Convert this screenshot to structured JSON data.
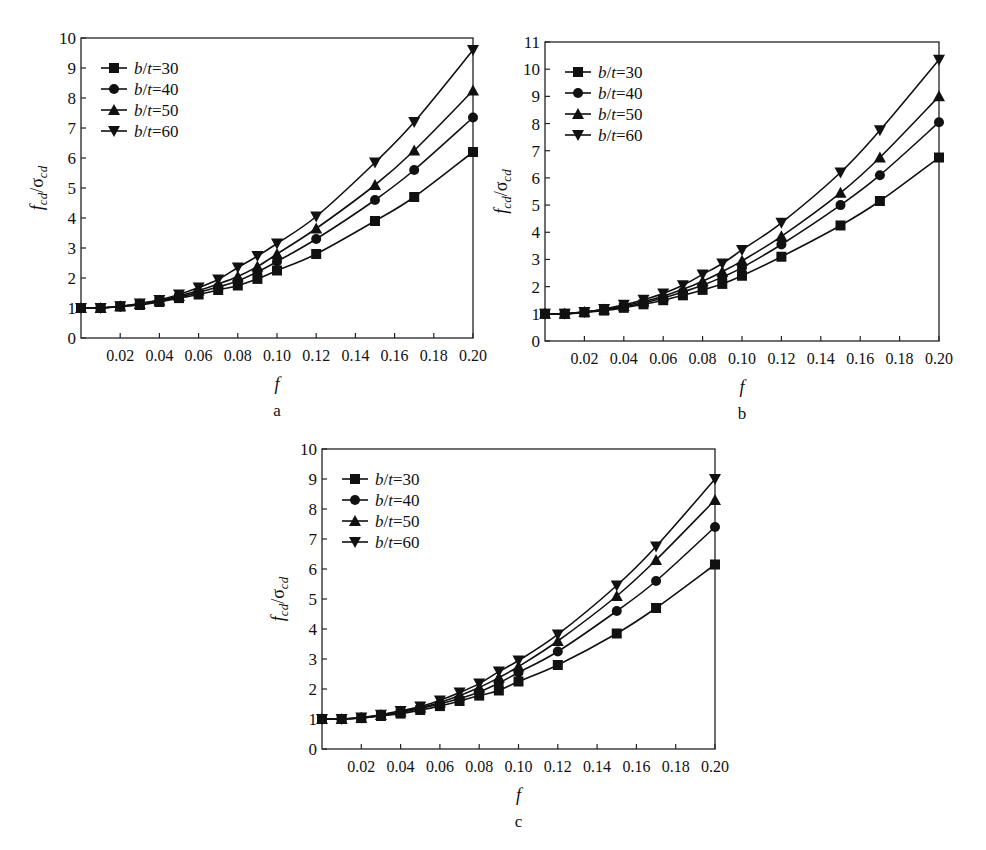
{
  "figure": {
    "panels": [
      {
        "id": "a",
        "sublabel": "a"
      },
      {
        "id": "b",
        "sublabel": "b"
      },
      {
        "id": "c",
        "sublabel": "c"
      }
    ]
  },
  "chart_data": [
    {
      "type": "line",
      "panel": "a",
      "title": "",
      "xlabel": "f",
      "ylabel": "f_cd/σ_cd",
      "xlim": [
        0,
        0.2
      ],
      "ylim": [
        0,
        10
      ],
      "xticks": [
        "0.02",
        "0.04",
        "0.06",
        "0.08",
        "0.10",
        "0.12",
        "0.14",
        "0.16",
        "0.18",
        "0.20"
      ],
      "yticks": [
        "0",
        "1",
        "2",
        "3",
        "4",
        "5",
        "6",
        "7",
        "8",
        "9",
        "10"
      ],
      "legend_position": "upper left",
      "grid": false,
      "x": [
        0,
        0.01,
        0.02,
        0.03,
        0.04,
        0.05,
        0.06,
        0.07,
        0.08,
        0.09,
        0.1,
        0.12,
        0.15,
        0.17,
        0.2
      ],
      "series": [
        {
          "name": "b/t=30",
          "marker": "square",
          "values": [
            1.0,
            1.0,
            1.05,
            1.1,
            1.2,
            1.33,
            1.45,
            1.6,
            1.75,
            1.97,
            2.25,
            2.8,
            3.9,
            4.7,
            6.2
          ]
        },
        {
          "name": "b/t=40",
          "marker": "circle",
          "values": [
            1.0,
            1.0,
            1.05,
            1.12,
            1.23,
            1.37,
            1.52,
            1.7,
            1.9,
            2.2,
            2.55,
            3.3,
            4.6,
            5.6,
            7.35
          ]
        },
        {
          "name": "b/t=50",
          "marker": "triangle-up",
          "values": [
            1.0,
            1.0,
            1.06,
            1.13,
            1.25,
            1.4,
            1.58,
            1.8,
            2.05,
            2.38,
            2.8,
            3.65,
            5.1,
            6.25,
            8.25
          ]
        },
        {
          "name": "b/t=60",
          "marker": "triangle-down",
          "values": [
            1.0,
            1.0,
            1.06,
            1.15,
            1.27,
            1.45,
            1.68,
            1.95,
            2.35,
            2.73,
            3.15,
            4.05,
            5.85,
            7.2,
            9.6
          ]
        }
      ]
    },
    {
      "type": "line",
      "panel": "b",
      "title": "",
      "xlabel": "f",
      "ylabel": "f_cd/σ_cd",
      "xlim": [
        0,
        0.2
      ],
      "ylim": [
        0,
        11
      ],
      "xticks": [
        "0.02",
        "0.04",
        "0.06",
        "0.08",
        "0.10",
        "0.12",
        "0.14",
        "0.16",
        "0.18",
        "0.20"
      ],
      "yticks": [
        "0",
        "1",
        "2",
        "3",
        "4",
        "5",
        "6",
        "7",
        "8",
        "9",
        "10",
        "11"
      ],
      "legend_position": "upper left",
      "grid": false,
      "x": [
        0,
        0.01,
        0.02,
        0.03,
        0.04,
        0.05,
        0.06,
        0.07,
        0.08,
        0.09,
        0.1,
        0.12,
        0.15,
        0.17,
        0.2
      ],
      "series": [
        {
          "name": "b/t=30",
          "marker": "square",
          "values": [
            1.0,
            1.0,
            1.05,
            1.12,
            1.22,
            1.35,
            1.5,
            1.68,
            1.88,
            2.1,
            2.4,
            3.1,
            4.25,
            5.15,
            6.75
          ]
        },
        {
          "name": "b/t=40",
          "marker": "circle",
          "values": [
            1.0,
            1.0,
            1.06,
            1.14,
            1.26,
            1.4,
            1.58,
            1.8,
            2.05,
            2.35,
            2.7,
            3.55,
            5.0,
            6.1,
            8.05
          ]
        },
        {
          "name": "b/t=50",
          "marker": "triangle-up",
          "values": [
            1.0,
            1.0,
            1.07,
            1.16,
            1.29,
            1.45,
            1.65,
            1.9,
            2.2,
            2.55,
            2.95,
            3.85,
            5.45,
            6.75,
            9.0
          ]
        },
        {
          "name": "b/t=60",
          "marker": "triangle-down",
          "values": [
            1.0,
            1.0,
            1.07,
            1.18,
            1.33,
            1.52,
            1.75,
            2.05,
            2.45,
            2.85,
            3.35,
            4.35,
            6.2,
            7.75,
            10.35
          ]
        }
      ]
    },
    {
      "type": "line",
      "panel": "c",
      "title": "",
      "xlabel": "f",
      "ylabel": "f_cd/σ_cd",
      "xlim": [
        0,
        0.2
      ],
      "ylim": [
        0,
        10
      ],
      "xticks": [
        "0.02",
        "0.04",
        "0.06",
        "0.08",
        "0.10",
        "0.12",
        "0.14",
        "0.16",
        "0.18",
        "0.20"
      ],
      "yticks": [
        "0",
        "1",
        "2",
        "3",
        "4",
        "5",
        "6",
        "7",
        "8",
        "9",
        "10"
      ],
      "legend_position": "upper left",
      "grid": false,
      "x": [
        0,
        0.01,
        0.02,
        0.03,
        0.04,
        0.05,
        0.06,
        0.07,
        0.08,
        0.09,
        0.1,
        0.12,
        0.15,
        0.17,
        0.2
      ],
      "series": [
        {
          "name": "b/t=30",
          "marker": "square",
          "values": [
            1.0,
            1.0,
            1.03,
            1.1,
            1.18,
            1.3,
            1.43,
            1.6,
            1.78,
            1.95,
            2.25,
            2.8,
            3.85,
            4.7,
            6.15
          ]
        },
        {
          "name": "b/t=40",
          "marker": "circle",
          "values": [
            1.0,
            1.0,
            1.04,
            1.12,
            1.22,
            1.35,
            1.5,
            1.68,
            1.9,
            2.2,
            2.55,
            3.25,
            4.6,
            5.6,
            7.4
          ]
        },
        {
          "name": "b/t=50",
          "marker": "triangle-up",
          "values": [
            1.0,
            1.0,
            1.04,
            1.13,
            1.25,
            1.38,
            1.55,
            1.78,
            2.05,
            2.38,
            2.75,
            3.6,
            5.1,
            6.3,
            8.3
          ]
        },
        {
          "name": "b/t=60",
          "marker": "triangle-down",
          "values": [
            1.0,
            1.0,
            1.05,
            1.14,
            1.27,
            1.42,
            1.62,
            1.88,
            2.18,
            2.58,
            2.95,
            3.82,
            5.45,
            6.75,
            9.0
          ]
        }
      ]
    }
  ]
}
